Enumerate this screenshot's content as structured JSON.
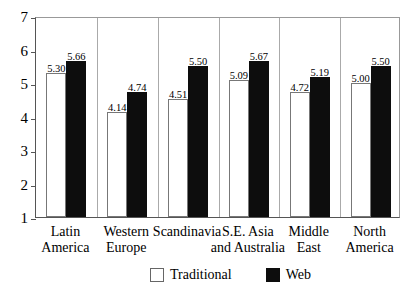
{
  "chart_data": {
    "type": "bar",
    "title": "",
    "subtitle": "",
    "xlabel": "",
    "ylabel": "",
    "ylim": [
      1,
      7
    ],
    "yticks": [
      "7",
      "6",
      "5",
      "4",
      "3",
      "2",
      "1"
    ],
    "grid": false,
    "legend_position": "bottom-center",
    "categories": [
      "Latin America",
      "Western Europe",
      "Scandinavia",
      "S.E. Asia and Australia",
      "Middle East",
      "North America"
    ],
    "category_lines": [
      [
        "Latin",
        "America"
      ],
      [
        "Western",
        "Europe"
      ],
      [
        "Scandinavia",
        ""
      ],
      [
        "S.E. Asia",
        "and Australia"
      ],
      [
        "Middle",
        "East"
      ],
      [
        "North",
        "America"
      ]
    ],
    "series": [
      {
        "name": "Traditional",
        "color": "#ffffff",
        "values": [
          5.3,
          4.14,
          4.51,
          5.09,
          4.72,
          5.0
        ],
        "labels": [
          "5.30",
          "4.14",
          "4.51",
          "5.09",
          "4.72",
          "5.00"
        ]
      },
      {
        "name": "Web",
        "color": "#0d0d0d",
        "values": [
          5.66,
          4.74,
          5.5,
          5.67,
          5.19,
          5.5
        ],
        "labels": [
          "5.66",
          "4.74",
          "5.50",
          "5.67",
          "5.19",
          "5.50"
        ]
      }
    ]
  },
  "legend": {
    "entries": [
      {
        "label": "Traditional",
        "swatch": "traditional"
      },
      {
        "label": "Web",
        "swatch": "web"
      }
    ]
  }
}
